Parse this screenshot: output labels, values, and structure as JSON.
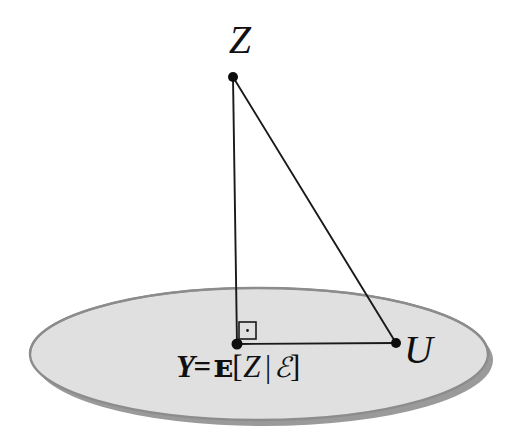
{
  "figure": {
    "background_color": "#ffffff"
  },
  "plane": {
    "name": "sigma-algebra-plane",
    "shape": "ellipse",
    "fill_color": "#e0e0e0",
    "outline_color": "#8c8c8c",
    "shadow_color": "#9a9a9a",
    "center_x": 259,
    "center_y": 354,
    "radius_x": 229,
    "radius_y": 66
  },
  "points": [
    {
      "id": "Z",
      "label": "Z",
      "x": 233,
      "y": 77,
      "label_x": 236,
      "label_y": 40,
      "dot_radius": 5.0
    },
    {
      "id": "Y",
      "label": "Y",
      "x": 237,
      "y": 344,
      "label_x": 238,
      "label_y": 370,
      "dot_radius": 5.5
    },
    {
      "id": "U",
      "label": "U",
      "x": 396,
      "y": 343,
      "label_x": 425,
      "label_y": 352,
      "dot_radius": 5.0
    }
  ],
  "segments": [
    {
      "id": "ZY",
      "from": "Z",
      "to": "Y",
      "x1": 233,
      "y1": 77,
      "x2": 237,
      "y2": 344,
      "color": "#1a1a1a",
      "width": 1.9
    },
    {
      "id": "ZU",
      "from": "Z",
      "to": "U",
      "x1": 233,
      "y1": 77,
      "x2": 396,
      "y2": 343,
      "color": "#1a1a1a",
      "width": 1.9
    },
    {
      "id": "YU",
      "from": "Y",
      "to": "U",
      "x1": 237,
      "y1": 344,
      "x2": 396,
      "y2": 343,
      "color": "#1a1a1a",
      "width": 1.9
    }
  ],
  "right_angle_marker": {
    "name": "right-angle-marker",
    "x": 239,
    "y": 322,
    "size": 20,
    "has_center_dot": true,
    "color": "#1a1a1a"
  },
  "labels": {
    "z_label": "Z",
    "u_label": "U",
    "formula": {
      "full_text": "Y= E[Z | E]",
      "lhs": "Y",
      "equals": "=",
      "expectation_symbol": "ᴇ",
      "open_bracket": "[",
      "random_variable": "Z",
      "conditional_bar": "|",
      "sigma_algebra_symbol": "ℰ",
      "close_bracket": "]"
    }
  }
}
